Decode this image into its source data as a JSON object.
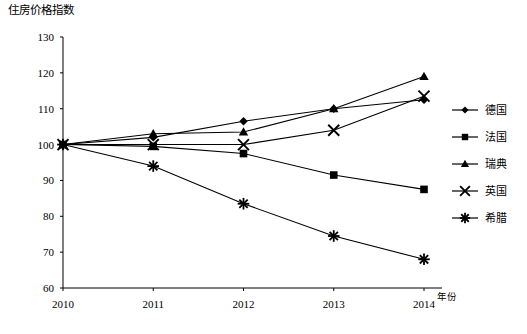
{
  "chart_data": {
    "type": "line",
    "title": "住房价格指数",
    "xlabel": "年份",
    "ylabel": "",
    "categories": [
      "2010",
      "2011",
      "2012",
      "2013",
      "2014"
    ],
    "x": [
      2010,
      2011,
      2012,
      2013,
      2014
    ],
    "xlim": [
      2010,
      2014
    ],
    "ylim": [
      60,
      130
    ],
    "yticks": [
      60,
      70,
      80,
      90,
      100,
      110,
      120,
      130
    ],
    "grid": false,
    "legend_position": "right",
    "series": [
      {
        "name": "德国",
        "marker": "diamond",
        "values": [
          100,
          102,
          106.5,
          110,
          112.5
        ]
      },
      {
        "name": "法国",
        "marker": "square",
        "values": [
          100,
          99.5,
          97.5,
          91.5,
          87.5
        ]
      },
      {
        "name": "瑞典",
        "marker": "triangle",
        "values": [
          100,
          103,
          103.5,
          110,
          119
        ]
      },
      {
        "name": "英国",
        "marker": "cross",
        "values": [
          100,
          100,
          100,
          104,
          113.5
        ]
      },
      {
        "name": "希腊",
        "marker": "asterisk",
        "values": [
          100,
          94,
          83.5,
          74.5,
          68
        ]
      }
    ]
  },
  "legend": {
    "items": [
      {
        "label": "德国",
        "marker": "diamond"
      },
      {
        "label": "法国",
        "marker": "square"
      },
      {
        "label": "瑞典",
        "marker": "triangle"
      },
      {
        "label": "英国",
        "marker": "cross"
      },
      {
        "label": "希腊",
        "marker": "asterisk"
      }
    ]
  },
  "colors": {
    "line": "#000000",
    "axis": "#000000",
    "background": "#ffffff"
  }
}
